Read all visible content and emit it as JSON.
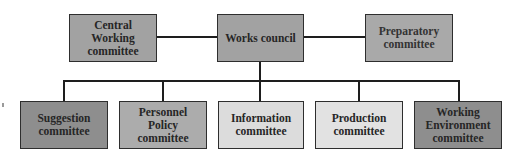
{
  "diagram": {
    "colors": {
      "dark": "#8e8e8e",
      "medium": "#a9a9a9",
      "light": "#dcdcdc",
      "top": "#a2a2a2",
      "border": "#2e2e2e",
      "line": "#1e1e1e"
    },
    "top_row": [
      {
        "id": "central-working-committee",
        "label": "Central Working committee",
        "shade": "top"
      },
      {
        "id": "works-council",
        "label": "Works council",
        "shade": "top"
      },
      {
        "id": "preparatory-committee",
        "label": "Preparatory committee",
        "shade": "top"
      }
    ],
    "bottom_row": [
      {
        "id": "suggestion-committee",
        "label": "Suggestion committee",
        "shade": "dark"
      },
      {
        "id": "personnel-policy-committee",
        "label": "Personnel Policy committee",
        "shade": "medium"
      },
      {
        "id": "information-committee",
        "label": "Information committee",
        "shade": "light"
      },
      {
        "id": "production-committee",
        "label": "Production committee",
        "shade": "light"
      },
      {
        "id": "working-environment-committee",
        "label": "Working Environment committee",
        "shade": "dark"
      }
    ],
    "connections": [
      {
        "from": "works-council",
        "to": "central-working-committee",
        "type": "horizontal"
      },
      {
        "from": "works-council",
        "to": "preparatory-committee",
        "type": "horizontal"
      },
      {
        "from": "works-council",
        "to": "suggestion-committee",
        "type": "tree"
      },
      {
        "from": "works-council",
        "to": "personnel-policy-committee",
        "type": "tree"
      },
      {
        "from": "works-council",
        "to": "information-committee",
        "type": "tree"
      },
      {
        "from": "works-council",
        "to": "production-committee",
        "type": "tree"
      },
      {
        "from": "works-council",
        "to": "working-environment-committee",
        "type": "tree"
      }
    ]
  }
}
